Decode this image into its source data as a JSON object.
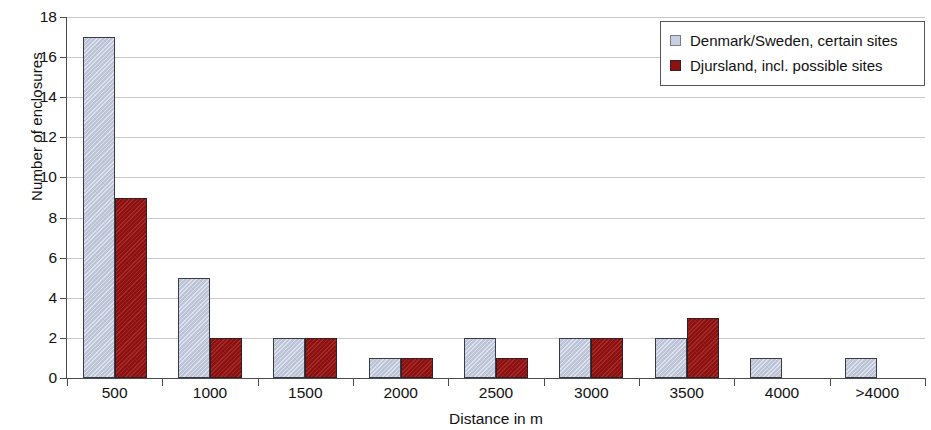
{
  "chart_data": {
    "type": "bar",
    "title": "",
    "xlabel": "Distance in m",
    "ylabel": "Number of enclosures",
    "categories": [
      "500",
      "1000",
      "1500",
      "2000",
      "2500",
      "3000",
      "3500",
      "4000",
      ">4000"
    ],
    "series": [
      {
        "name": "Denmark/Sweden, certain sites",
        "color": "#c3cade",
        "values": [
          17,
          5,
          2,
          1,
          2,
          2,
          2,
          1,
          1
        ]
      },
      {
        "name": "Djursland, incl. possible sites",
        "color": "#9b1212",
        "values": [
          9,
          2,
          2,
          1,
          1,
          2,
          3,
          0,
          0
        ]
      }
    ],
    "ylim": [
      0,
      18
    ],
    "ytick_values": [
      0,
      2,
      4,
      6,
      8,
      10,
      12,
      14,
      16,
      18
    ],
    "ytick_labels": [
      "0",
      "2",
      "4",
      "6",
      "8",
      "10",
      "12",
      "14",
      "16",
      "18"
    ],
    "grid": true,
    "legend_position": "top-right"
  },
  "legend": {
    "items": [
      {
        "label": "Denmark/Sweden, certain sites",
        "swatch": "legend-swatch-series-a"
      },
      {
        "label": "Djursland, incl. possible sites",
        "swatch": "legend-swatch-series-b"
      }
    ]
  }
}
